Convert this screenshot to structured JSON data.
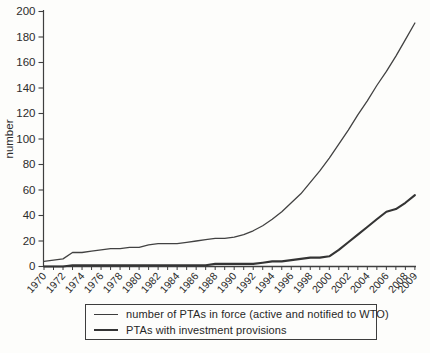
{
  "figure": {
    "background": "#fdfdfb",
    "axis_color": "#3f3f3f",
    "text_color": "#2c2c2c"
  },
  "legend": {
    "items": [
      {
        "label": "number of PTAs in force (active and notified to WTO)",
        "color": "#3c3c3c",
        "thickness": 1.6
      },
      {
        "label": "PTAs with investment provisions",
        "color": "#343434",
        "thickness": 2.4
      }
    ]
  },
  "chart_data": {
    "type": "line",
    "title": "",
    "xlabel": "",
    "ylabel": "number",
    "ylim": [
      0,
      200
    ],
    "yticks": [
      0,
      20,
      40,
      60,
      80,
      100,
      120,
      140,
      160,
      180,
      200
    ],
    "x": [
      1970,
      1971,
      1972,
      1973,
      1974,
      1975,
      1976,
      1977,
      1978,
      1979,
      1980,
      1981,
      1982,
      1983,
      1984,
      1985,
      1986,
      1987,
      1988,
      1989,
      1990,
      1991,
      1992,
      1993,
      1994,
      1995,
      1996,
      1997,
      1998,
      1999,
      2000,
      2001,
      2002,
      2003,
      2004,
      2005,
      2006,
      2007,
      2008,
      2009
    ],
    "x_tick_labels": [
      "1970",
      "1972",
      "1974",
      "1976",
      "1978",
      "1980",
      "1982",
      "1984",
      "1986",
      "1988",
      "1990",
      "1992",
      "1994",
      "1996",
      "1998",
      "2000",
      "2002",
      "2004",
      "2006",
      "2008",
      "2009"
    ],
    "grid": false,
    "legend_position": "bottom",
    "series": [
      {
        "name": "number of PTAs in force (active and notified to WTO)",
        "color": "#424242",
        "width": 1.3,
        "values": [
          4,
          5,
          6,
          11,
          11,
          12,
          13,
          14,
          14,
          15,
          15,
          17,
          18,
          18,
          18,
          19,
          20,
          21,
          22,
          22,
          23,
          25,
          28,
          32,
          37,
          43,
          50,
          57,
          66,
          75,
          85,
          96,
          107,
          119,
          130,
          142,
          153,
          165,
          178,
          191
        ]
      },
      {
        "name": "PTAs with investment provisions",
        "color": "#343434",
        "width": 2.1,
        "values": [
          0,
          0,
          0,
          1,
          1,
          1,
          1,
          1,
          1,
          1,
          1,
          1,
          1,
          1,
          1,
          1,
          1,
          1,
          2,
          2,
          2,
          2,
          2,
          3,
          4,
          4,
          5,
          6,
          7,
          7,
          8,
          13,
          19,
          25,
          31,
          37,
          43,
          45,
          50,
          56
        ]
      }
    ]
  }
}
